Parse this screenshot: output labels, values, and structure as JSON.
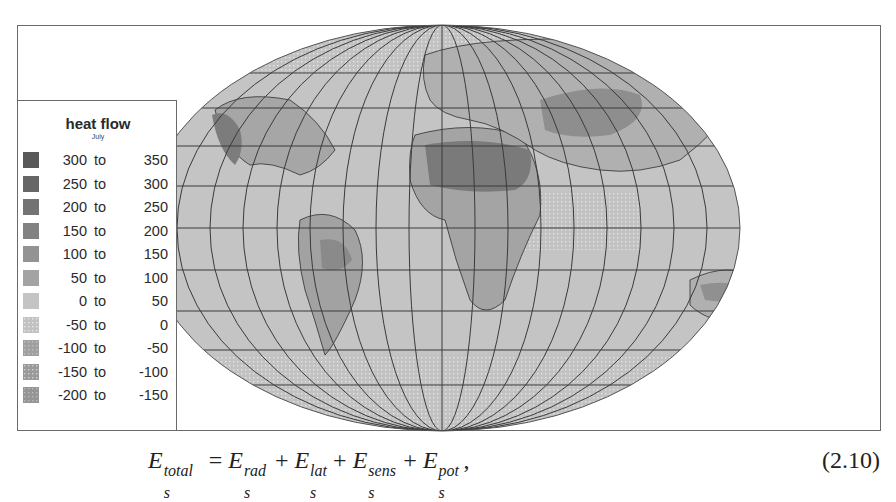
{
  "figure": {
    "legend": {
      "title": "heat flow",
      "subtitle": "July",
      "items": [
        {
          "from": "300",
          "to_word": "to",
          "to": "350",
          "color": "#595959",
          "pattern": "solid"
        },
        {
          "from": "250",
          "to_word": "to",
          "to": "300",
          "color": "#666666",
          "pattern": "solid"
        },
        {
          "from": "200",
          "to_word": "to",
          "to": "250",
          "color": "#737373",
          "pattern": "solid"
        },
        {
          "from": "150",
          "to_word": "to",
          "to": "200",
          "color": "#828282",
          "pattern": "solid"
        },
        {
          "from": "100",
          "to_word": "to",
          "to": "150",
          "color": "#939393",
          "pattern": "solid"
        },
        {
          "from": "50",
          "to_word": "to",
          "to": "100",
          "color": "#a3a3a3",
          "pattern": "solid"
        },
        {
          "from": "0",
          "to_word": "to",
          "to": "50",
          "color": "#c4c4c4",
          "pattern": "solid"
        },
        {
          "from": "-50",
          "to_word": "to",
          "to": "0",
          "color": "#cfcfcf",
          "pattern": "dots"
        },
        {
          "from": "-100",
          "to_word": "to",
          "to": "-50",
          "color": "#a8a8a8",
          "pattern": "dots"
        },
        {
          "from": "-150",
          "to_word": "to",
          "to": "-100",
          "color": "#989898",
          "pattern": "dots"
        },
        {
          "from": "-200",
          "to_word": "to",
          "to": "-150",
          "color": "#888888",
          "pattern": "dots"
        }
      ]
    },
    "map": {
      "projection": "Mollweide-like world map",
      "ocean_color": "#c4c4c4",
      "graticule_color": "#3a3a3a"
    }
  },
  "equation": {
    "lhs": {
      "base": "E",
      "sup": "total",
      "sub": "s"
    },
    "terms": [
      {
        "base": "E",
        "sup": "rad",
        "sub": "s"
      },
      {
        "base": "E",
        "sup": "lat",
        "sub": "s"
      },
      {
        "base": "E",
        "sup": "sens",
        "sub": "s"
      },
      {
        "base": "E",
        "sup": "pot",
        "sub": "s"
      }
    ],
    "equals": "=",
    "plus": "+",
    "trailing": ",",
    "number": "(2.10)"
  }
}
